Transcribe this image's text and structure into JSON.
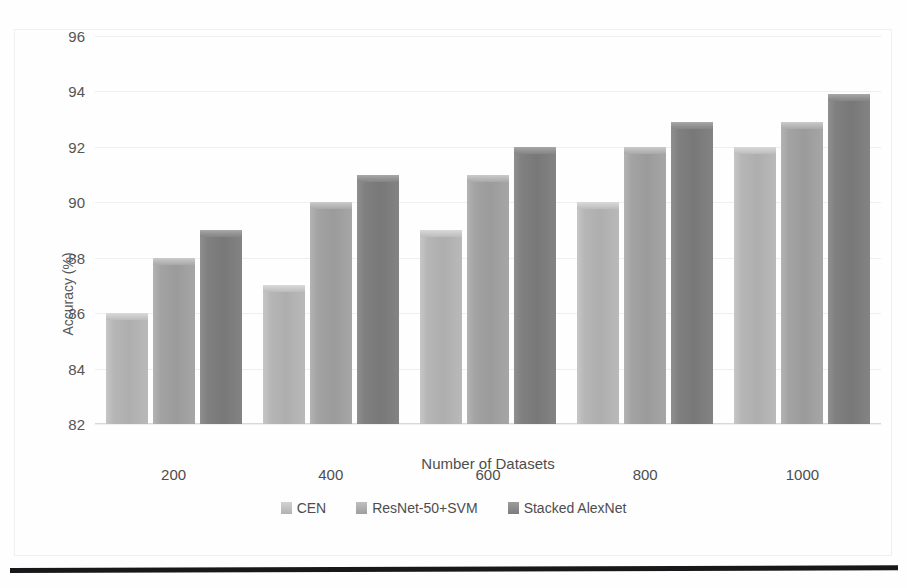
{
  "chart_data": {
    "type": "bar",
    "title": "",
    "xlabel": "Number of Datasets",
    "ylabel": "Accuracy (%)",
    "categories": [
      "200",
      "400",
      "600",
      "800",
      "1000"
    ],
    "series": [
      {
        "name": "CEN",
        "values": [
          86,
          87,
          89,
          90,
          92
        ],
        "color": "#b4b4b4"
      },
      {
        "name": "ResNet-50+SVM",
        "values": [
          88,
          90,
          91,
          92,
          92.9
        ],
        "color": "#a0a0a0"
      },
      {
        "name": "Stacked AlexNet",
        "values": [
          89,
          91,
          92,
          92.9,
          93.9
        ],
        "color": "#808080"
      }
    ],
    "ylim": [
      82,
      96
    ],
    "yticks": [
      82,
      84,
      86,
      88,
      90,
      92,
      94,
      96
    ],
    "grid": true,
    "legend_position": "bottom"
  }
}
